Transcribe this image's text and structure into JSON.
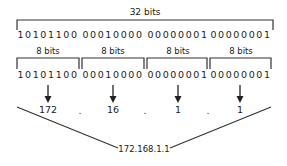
{
  "diagram": {
    "total_label": "32 bits",
    "full_bits": [
      "10101100",
      "00010000",
      "00000001",
      "00000001"
    ],
    "octets": [
      {
        "label": "8 bits",
        "bits": "10101100",
        "decimal": "172"
      },
      {
        "label": "8 bits",
        "bits": "00010000",
        "decimal": "16"
      },
      {
        "label": "8 bits",
        "bits": "00000001",
        "decimal": "1"
      },
      {
        "label": "8 bits",
        "bits": "00000001",
        "decimal": "1"
      }
    ],
    "separator": ".",
    "result_ip": "172.168.1.1",
    "line_color": "#333333"
  }
}
